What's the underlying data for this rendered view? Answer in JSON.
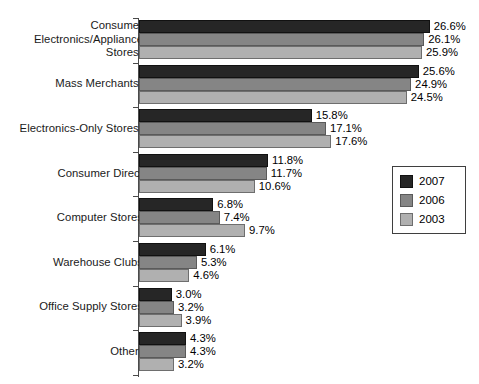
{
  "chart_data": {
    "type": "bar",
    "orientation": "horizontal",
    "title": "",
    "xlabel": "",
    "ylabel": "",
    "grid": false,
    "legend_position": "right-middle",
    "xlim": [
      0,
      28
    ],
    "value_suffix": "%",
    "categories": [
      "Consumer Electronics/Appliance Stores",
      "Mass Merchants",
      "Electronics-Only Stores",
      "Consumer Direct",
      "Computer Stores",
      "Warehouse Clubs",
      "Office Supply Stores",
      "Other"
    ],
    "category_labels": [
      {
        "lines": [
          "Consumer",
          "Electronics/Appliance",
          "Stores"
        ],
        "footnote": "1"
      },
      {
        "lines": [
          "Mass Merchants"
        ],
        "footnote": "2"
      },
      {
        "lines": [
          "Electronics-Only Stores"
        ],
        "footnote": "3"
      },
      {
        "lines": [
          "Consumer Direct"
        ],
        "footnote": ""
      },
      {
        "lines": [
          "Computer Stores"
        ],
        "footnote": ""
      },
      {
        "lines": [
          "Warehouse Clubs"
        ],
        "footnote": ""
      },
      {
        "lines": [
          "Office Supply Stores"
        ],
        "footnote": ""
      },
      {
        "lines": [
          "Other"
        ],
        "footnote": "4"
      }
    ],
    "series": [
      {
        "name": "2007",
        "color": "#262626",
        "values": [
          26.6,
          25.6,
          15.8,
          11.8,
          6.8,
          6.1,
          3.0,
          4.3
        ],
        "labels": [
          "26.6%",
          "25.6%",
          "15.8%",
          "11.8%",
          "6.8%",
          "6.1%",
          "3.0%",
          "4.3%"
        ]
      },
      {
        "name": "2006",
        "color": "#858585",
        "values": [
          26.1,
          24.9,
          17.1,
          11.7,
          7.4,
          5.3,
          3.2,
          4.3
        ],
        "labels": [
          "26.1%",
          "24.9%",
          "17.1%",
          "11.7%",
          "7.4%",
          "5.3%",
          "3.2%",
          "4.3%"
        ]
      },
      {
        "name": "2003",
        "color": "#b0b0b0",
        "values": [
          25.9,
          24.5,
          17.6,
          10.6,
          9.7,
          4.6,
          3.9,
          3.2
        ],
        "labels": [
          "25.9%",
          "24.5%",
          "17.6%",
          "10.6%",
          "9.7%",
          "4.6%",
          "3.9%",
          "3.2%"
        ]
      }
    ]
  },
  "legend": {
    "items": [
      {
        "label": "2007",
        "swatch": "s2007"
      },
      {
        "label": "2006",
        "swatch": "s2006"
      },
      {
        "label": "2003",
        "swatch": "s2003"
      }
    ]
  }
}
